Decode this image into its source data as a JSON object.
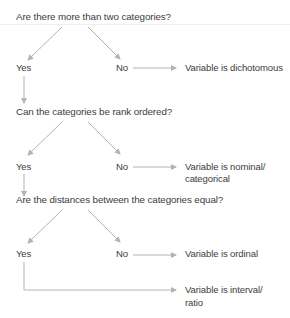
{
  "diagram": {
    "type": "decision-flowchart",
    "colors": {
      "text": "#3c3c3c",
      "arrow": "#b3b3b3",
      "divider": "#eeeeee"
    },
    "steps": [
      {
        "question": "Are there more than two categories?",
        "yes_label": "Yes",
        "no_label": "No",
        "no_result": "Variable is dichotomous"
      },
      {
        "question": "Can the categories be rank ordered?",
        "yes_label": "Yes",
        "no_label": "No",
        "no_result_line1": "Variable is nominal/",
        "no_result_line2": "categorical"
      },
      {
        "question": "Are the distances between the categories equal?",
        "yes_label": "Yes",
        "no_label": "No",
        "no_result": "Variable is ordinal",
        "yes_result_line1": "Variable is interval/",
        "yes_result_line2": "ratio"
      }
    ]
  }
}
